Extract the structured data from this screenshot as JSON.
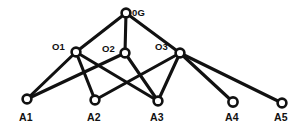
{
  "diagram": {
    "type": "node-link-graph",
    "background_color": "#ffffff",
    "line_color": "#111111",
    "node_fill_color": "#ffffff",
    "nodes": [
      {
        "id": "0G",
        "label": "0G",
        "x": 126,
        "y": 13,
        "r": 4.4,
        "level": "root",
        "label_x": 132,
        "label_y": 8,
        "label_class": "label-internal"
      },
      {
        "id": "O1",
        "label": "O1",
        "x": 76,
        "y": 52,
        "r": 4.4,
        "level": "middle",
        "label_x": 52,
        "label_y": 42,
        "label_class": "label-internal"
      },
      {
        "id": "O2",
        "label": "O2",
        "x": 125,
        "y": 53,
        "r": 4.4,
        "level": "middle",
        "label_x": 102,
        "label_y": 44,
        "label_class": "label-internal"
      },
      {
        "id": "O3",
        "label": "O3",
        "x": 180,
        "y": 53,
        "r": 4.4,
        "level": "middle",
        "label_x": 155,
        "label_y": 42,
        "label_class": "label-internal"
      },
      {
        "id": "A1",
        "label": "A1",
        "x": 27,
        "y": 99,
        "r": 4.4,
        "level": "leaf",
        "label_x": 19,
        "label_y": 112,
        "label_class": "label-leaf"
      },
      {
        "id": "A2",
        "label": "A2",
        "x": 95,
        "y": 100,
        "r": 4.4,
        "level": "leaf",
        "label_x": 87,
        "label_y": 112,
        "label_class": "label-leaf"
      },
      {
        "id": "A3",
        "label": "A3",
        "x": 158,
        "y": 101,
        "r": 4.4,
        "level": "leaf",
        "label_x": 150,
        "label_y": 112,
        "label_class": "label-leaf"
      },
      {
        "id": "A4",
        "label": "A4",
        "x": 233,
        "y": 102,
        "r": 4.6,
        "level": "leaf",
        "label_x": 225,
        "label_y": 112,
        "label_class": "label-leaf"
      },
      {
        "id": "A5",
        "label": "A5",
        "x": 282,
        "y": 103,
        "r": 4.4,
        "level": "leaf",
        "label_x": 274,
        "label_y": 112,
        "label_class": "label-leaf"
      }
    ],
    "edges": [
      {
        "from": "0G",
        "to": "O1",
        "x1": 126,
        "y1": 13,
        "x2": 76,
        "y2": 52
      },
      {
        "from": "0G",
        "to": "O2",
        "x1": 126,
        "y1": 13,
        "x2": 125,
        "y2": 53
      },
      {
        "from": "0G",
        "to": "O3",
        "x1": 126,
        "y1": 13,
        "x2": 180,
        "y2": 53
      },
      {
        "from": "O1",
        "to": "A1",
        "x1": 76,
        "y1": 52,
        "x2": 27,
        "y2": 99
      },
      {
        "from": "O1",
        "to": "A2",
        "x1": 76,
        "y1": 52,
        "x2": 95,
        "y2": 100
      },
      {
        "from": "O1",
        "to": "A3",
        "x1": 76,
        "y1": 52,
        "x2": 158,
        "y2": 101
      },
      {
        "from": "O2",
        "to": "A1",
        "x1": 125,
        "y1": 53,
        "x2": 27,
        "y2": 99
      },
      {
        "from": "O2",
        "to": "A3",
        "x1": 125,
        "y1": 53,
        "x2": 158,
        "y2": 101
      },
      {
        "from": "O3",
        "to": "A2",
        "x1": 180,
        "y1": 53,
        "x2": 95,
        "y2": 100
      },
      {
        "from": "O3",
        "to": "A3",
        "x1": 180,
        "y1": 53,
        "x2": 158,
        "y2": 101
      },
      {
        "from": "O3",
        "to": "A4",
        "x1": 180,
        "y1": 53,
        "x2": 233,
        "y2": 102
      },
      {
        "from": "O3",
        "to": "A5",
        "x1": 180,
        "y1": 53,
        "x2": 282,
        "y2": 103
      }
    ]
  }
}
